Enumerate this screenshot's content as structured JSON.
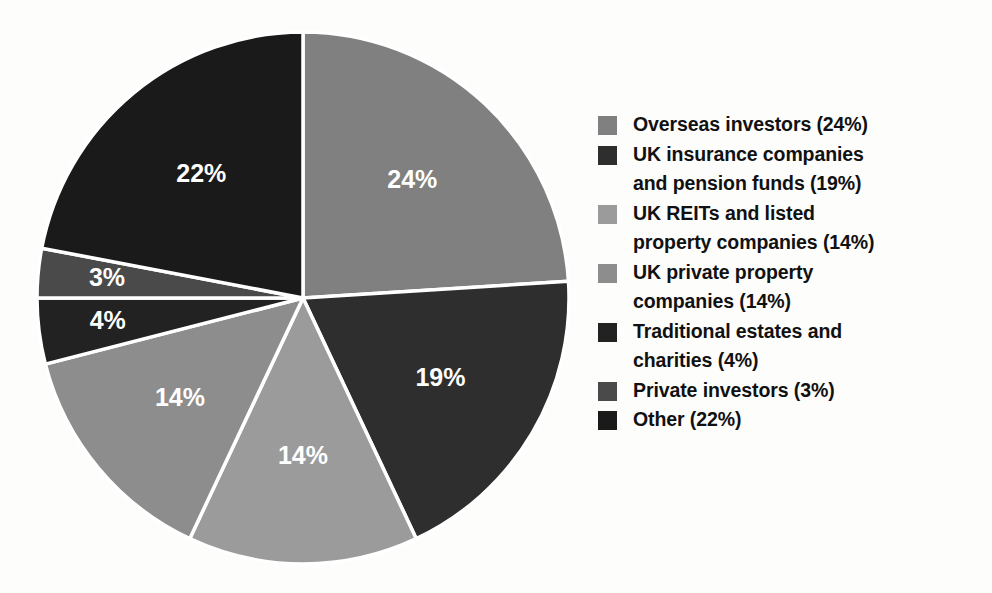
{
  "chart_data": {
    "type": "pie",
    "title": "",
    "subtitle": "",
    "xlabel": "",
    "ylabel": "",
    "legend_position": "right",
    "grid": false,
    "start_angle_deg": 0,
    "direction": "clockwise",
    "total_percent": 100,
    "categories": [
      "Overseas investors",
      "UK insurance companies and pension funds",
      "UK REITs and listed property companies",
      "UK private property companies",
      "Traditional estates and charities",
      "Private investors",
      "Other"
    ],
    "values": [
      24,
      19,
      14,
      14,
      4,
      3,
      22
    ],
    "colors": [
      "#808080",
      "#2e2e2e",
      "#9b9b9b",
      "#8d8d8d",
      "#222222",
      "#4a4a4a",
      "#1a1a1a"
    ],
    "slices": [
      {
        "label": "Overseas investors",
        "value": 24,
        "data_label": "24%",
        "legend_label": "Overseas investors (24%)",
        "color": "#808080"
      },
      {
        "label": "UK insurance companies and pension funds",
        "value": 19,
        "data_label": "19%",
        "legend_label": "UK insurance companies\nand pension funds (19%)",
        "color": "#2e2e2e"
      },
      {
        "label": "UK REITs and listed property companies",
        "value": 14,
        "data_label": "14%",
        "legend_label": "UK REITs and listed\nproperty companies (14%)",
        "color": "#9b9b9b"
      },
      {
        "label": "UK private property companies",
        "value": 14,
        "data_label": "14%",
        "legend_label": "UK private property\ncompanies (14%)",
        "color": "#8d8d8d"
      },
      {
        "label": "Traditional estates and charities",
        "value": 4,
        "data_label": "4%",
        "legend_label": "Traditional estates and\ncharities (4%)",
        "color": "#222222"
      },
      {
        "label": "Private investors",
        "value": 3,
        "data_label": "3%",
        "legend_label": "Private investors (3%)",
        "color": "#4a4a4a"
      },
      {
        "label": "Other",
        "value": 22,
        "data_label": "22%",
        "legend_label": "Other (22%)",
        "color": "#1a1a1a"
      }
    ],
    "slice_separator_color": "#ffffff",
    "data_label_color": "#ffffff"
  },
  "legend": {
    "items": [
      {
        "label": "Overseas investors (24%)",
        "color": "#808080"
      },
      {
        "label": "UK insurance companies\nand pension funds (19%)",
        "color": "#2e2e2e"
      },
      {
        "label": "UK REITs and listed\nproperty companies (14%)",
        "color": "#9b9b9b"
      },
      {
        "label": "UK private property\ncompanies (14%)",
        "color": "#8d8d8d"
      },
      {
        "label": "Traditional estates and\ncharities (4%)",
        "color": "#222222"
      },
      {
        "label": "Private investors (3%)",
        "color": "#4a4a4a"
      },
      {
        "label": "Other (22%)",
        "color": "#1a1a1a"
      }
    ]
  }
}
